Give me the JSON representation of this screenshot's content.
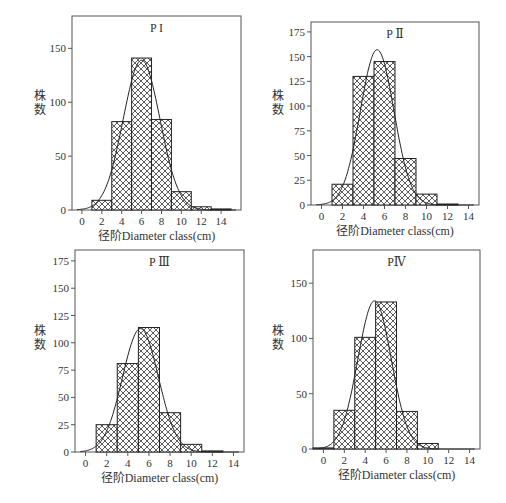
{
  "page": {
    "top_text": "",
    "caption": ""
  },
  "common": {
    "xlabel": "径阶Diameter class(cm)",
    "ylabel_line1": "株",
    "ylabel_line2": "数",
    "x_ticks": [
      0,
      2,
      4,
      6,
      8,
      10,
      12,
      14
    ]
  },
  "chart_data": [
    {
      "type": "bar",
      "title": "P I",
      "xlabel": "径阶Diameter class(cm)",
      "ylabel": "株数",
      "bin_width": 2,
      "categories": [
        2,
        4,
        6,
        8,
        10,
        12,
        14
      ],
      "values": [
        9,
        82,
        141,
        84,
        17,
        3,
        1
      ],
      "y_ticks": [
        0,
        50,
        100,
        150
      ],
      "ylim": [
        0,
        180
      ],
      "xlim": [
        -1,
        16
      ],
      "normal_curve": {
        "mean": 6.0,
        "peak": 139,
        "sd": 1.85
      },
      "frame": {
        "x": 72,
        "y": 16,
        "w": 169,
        "h": 194
      },
      "label": {
        "x": 40,
        "y": 100
      }
    },
    {
      "type": "bar",
      "title": "P Ⅱ",
      "xlabel": "径阶Diameter class(cm)",
      "ylabel": "株数",
      "bin_width": 2,
      "categories": [
        2,
        4,
        6,
        8,
        10,
        12
      ],
      "values": [
        21,
        130,
        145,
        47,
        11,
        1
      ],
      "y_ticks": [
        0,
        25,
        50,
        75,
        100,
        125,
        150,
        175
      ],
      "ylim": [
        0,
        185
      ],
      "xlim": [
        -1,
        15
      ],
      "normal_curve": {
        "mean": 5.3,
        "peak": 157,
        "sd": 1.6
      },
      "frame": {
        "x": 311,
        "y": 22,
        "w": 168,
        "h": 183
      },
      "label": {
        "x": 278,
        "y": 100
      }
    },
    {
      "type": "bar",
      "title": "P Ⅲ",
      "xlabel": "径阶Diameter class(cm)",
      "ylabel": "株数",
      "bin_width": 2,
      "categories": [
        2,
        4,
        6,
        8,
        10,
        12
      ],
      "values": [
        25,
        81,
        114,
        36,
        7,
        1
      ],
      "y_ticks": [
        0,
        25,
        50,
        75,
        100,
        125,
        150,
        175
      ],
      "ylim": [
        0,
        185
      ],
      "xlim": [
        -1,
        15
      ],
      "normal_curve": {
        "mean": 5.2,
        "peak": 113,
        "sd": 1.7
      },
      "frame": {
        "x": 75,
        "y": 250,
        "w": 169,
        "h": 202
      },
      "label": {
        "x": 40,
        "y": 335
      }
    },
    {
      "type": "bar",
      "title": "PⅣ",
      "xlabel": "径阶Diameter class(cm)",
      "ylabel": "株数",
      "bin_width": 2,
      "categories": [
        0,
        2,
        4,
        6,
        8,
        10
      ],
      "values": [
        1,
        35,
        101,
        133,
        34,
        5
      ],
      "y_ticks": [
        0,
        50,
        100,
        150
      ],
      "ylim": [
        0,
        180
      ],
      "xlim": [
        -1,
        15
      ],
      "normal_curve": {
        "mean": 4.9,
        "peak": 134,
        "sd": 1.6
      },
      "frame": {
        "x": 313,
        "y": 250,
        "w": 167,
        "h": 199
      },
      "label": {
        "x": 278,
        "y": 335
      }
    }
  ]
}
